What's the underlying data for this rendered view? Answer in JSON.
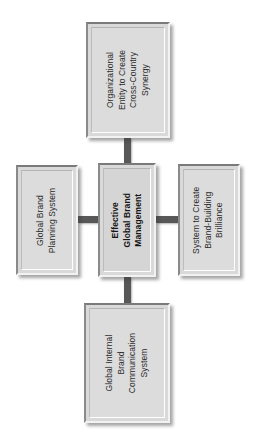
{
  "diagram": {
    "title": "Effective Global Brand Management",
    "orientation": "rotated-90-counterclockwise",
    "colors": {
      "box_fill": "#dcdcdc",
      "box_border_dark": "#7a7a7a",
      "box_border_light": "#f2f2f2",
      "connector": "#585858",
      "text": "#2b2b2b",
      "background": "#ffffff"
    },
    "center": {
      "id": "effective-global-brand-management",
      "lines": [
        "Effective",
        "Global Brand",
        "Management"
      ],
      "bold": true
    },
    "nodes": [
      {
        "id": "organizational-entity",
        "position": "top",
        "lines": [
          "Organizational",
          "Entity to Create",
          "Cross-Country",
          "Synergy"
        ]
      },
      {
        "id": "global-brand-planning-system",
        "position": "left",
        "lines": [
          "Global Brand",
          "Planning System"
        ]
      },
      {
        "id": "system-to-create-brand-building-brilliance",
        "position": "right",
        "lines": [
          "System to Create",
          "Brand-Building",
          "Brilliance"
        ]
      },
      {
        "id": "global-internal-brand-communication-system",
        "position": "bottom",
        "lines": [
          "Global Internal",
          "Brand",
          "Communication",
          "System"
        ]
      }
    ],
    "connectors": [
      {
        "id": "center-to-top",
        "from": "center",
        "to": "organizational-entity"
      },
      {
        "id": "center-to-left",
        "from": "center",
        "to": "global-brand-planning-system"
      },
      {
        "id": "center-to-right",
        "from": "center",
        "to": "system-to-create-brand-building-brilliance"
      },
      {
        "id": "center-to-bottom",
        "from": "center",
        "to": "global-internal-brand-communication-system"
      }
    ]
  }
}
